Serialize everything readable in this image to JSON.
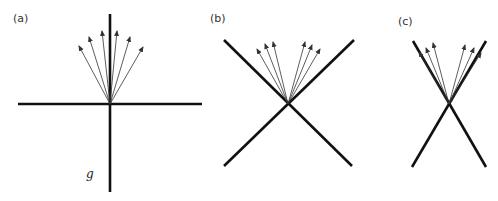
{
  "figure": {
    "panels": [
      {
        "id": "a",
        "label": "(a)",
        "label_pos": [
          13,
          22
        ],
        "origin": [
          110,
          104
        ],
        "lines": [
          {
            "x1": 110,
            "y1": 14,
            "x2": 110,
            "y2": 192
          },
          {
            "x1": 18,
            "y1": 104,
            "x2": 202,
            "y2": 104
          }
        ],
        "arrow_tips": [
          [
            79,
            46
          ],
          [
            89,
            37
          ],
          [
            102,
            31
          ],
          [
            117,
            31
          ],
          [
            130,
            37
          ],
          [
            143,
            47
          ]
        ],
        "annotation": {
          "text": "g",
          "pos": [
            86,
            178
          ]
        }
      },
      {
        "id": "b",
        "label": "(b)",
        "label_pos": [
          210,
          22
        ],
        "origin": [
          288,
          104
        ],
        "lines": [
          {
            "x1": 224,
            "y1": 40,
            "x2": 352,
            "y2": 166
          },
          {
            "x1": 354,
            "y1": 40,
            "x2": 224,
            "y2": 166
          }
        ],
        "arrow_tips": [
          [
            257,
            49
          ],
          [
            265,
            44
          ],
          [
            273,
            42
          ],
          [
            305,
            42
          ],
          [
            312,
            45
          ],
          [
            320,
            49
          ]
        ]
      },
      {
        "id": "c",
        "label": "(c)",
        "label_pos": [
          398,
          25
        ],
        "origin": [
          449,
          104
        ],
        "lines": [
          {
            "x1": 413,
            "y1": 41,
            "x2": 486,
            "y2": 167
          },
          {
            "x1": 486,
            "y1": 41,
            "x2": 412,
            "y2": 167
          }
        ],
        "arrow_tips": [
          [
            419,
            52
          ],
          [
            426,
            48
          ],
          [
            433,
            43
          ],
          [
            465,
            45
          ],
          [
            474,
            48
          ],
          [
            481,
            53
          ]
        ]
      }
    ]
  }
}
